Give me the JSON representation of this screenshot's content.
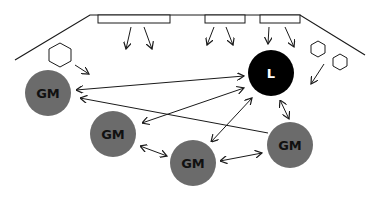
{
  "diagram": {
    "type": "cell signaling diagram",
    "colors": {
      "line": "#1a1a1a",
      "gm_fill": "#6b6b6b",
      "gm_text": "#111111",
      "leader_fill": "#000000",
      "leader_text": "#ffffff",
      "background": "#ffffff"
    },
    "nodes": {
      "gm1": {
        "label": "GM"
      },
      "gm2": {
        "label": "GM"
      },
      "gm3": {
        "label": "GM"
      },
      "gm4": {
        "label": "GM"
      },
      "leader": {
        "label": "L"
      }
    },
    "symbols": {
      "hexagons": 3,
      "membrane_rectangles": 3
    }
  }
}
